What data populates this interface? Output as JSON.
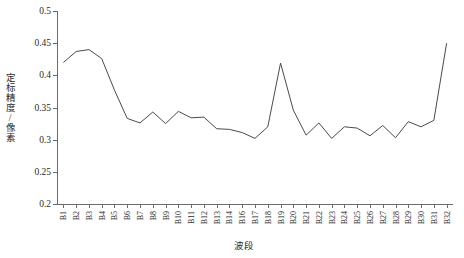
{
  "chart_data": {
    "type": "line",
    "title": "",
    "xlabel": "波段",
    "ylabel": "定标精度/像素",
    "ylim": [
      0.2,
      0.5
    ],
    "yticks": [
      0.2,
      0.25,
      0.3,
      0.35,
      0.4,
      0.45,
      0.5
    ],
    "ytick_labels": [
      "0.2",
      "0.25",
      "0.3",
      "0.35",
      "0.4",
      "0.45",
      "0.5"
    ],
    "grid": false,
    "legend": null,
    "categories": [
      "B1",
      "B2",
      "B3",
      "B4",
      "B5",
      "B6",
      "B7",
      "B8",
      "B9",
      "B10",
      "B11",
      "B12",
      "B13",
      "B14",
      "B16",
      "B17",
      "B18",
      "B19",
      "B20",
      "B21",
      "B22",
      "B23",
      "B24",
      "B25",
      "B26",
      "B27",
      "B28",
      "B29",
      "B30",
      "B31",
      "B32"
    ],
    "values": [
      0.42,
      0.437,
      0.44,
      0.426,
      0.377,
      0.333,
      0.326,
      0.343,
      0.325,
      0.344,
      0.334,
      0.335,
      0.317,
      0.316,
      0.311,
      0.302,
      0.32,
      0.419,
      0.346,
      0.307,
      0.326,
      0.302,
      0.32,
      0.318,
      0.306,
      0.322,
      0.303,
      0.328,
      0.32,
      0.33,
      0.45
    ]
  }
}
